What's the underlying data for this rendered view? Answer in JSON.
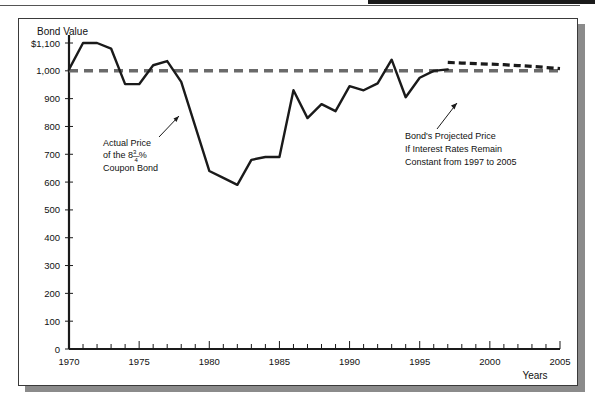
{
  "figure": {
    "y_axis_title": "Bond Value",
    "x_axis_title": "Years",
    "frame_color": "#3a3a3a",
    "shadow_color": "#8b8b8b",
    "series_color": "#1a1a1a",
    "par_line_color": "#6a6a6a"
  },
  "annotations": {
    "left": {
      "line1": "Actual Price",
      "line2_pre": "of the 8",
      "line2_num": "3",
      "line2_den": "4",
      "line2_post": "%",
      "line3": "Coupon Bond"
    },
    "right": {
      "line1": "Bond's Projected Price",
      "line2": "If Interest Rates Remain",
      "line3": "Constant from 1997 to 2005"
    }
  },
  "chart_data": {
    "type": "line",
    "title": "",
    "xlabel": "Years",
    "ylabel": "Bond Value",
    "xlim": [
      1970,
      2005
    ],
    "ylim": [
      0,
      1100
    ],
    "grid": false,
    "legend": "none",
    "y_ticks": [
      0,
      100,
      200,
      300,
      400,
      500,
      600,
      700,
      800,
      900,
      1000,
      1100
    ],
    "y_tick_labels": [
      "0",
      "100",
      "200",
      "300",
      "400",
      "500",
      "600",
      "700",
      "800",
      "900",
      "1,000",
      "$1,100"
    ],
    "x_ticks": [
      1970,
      1971,
      1972,
      1973,
      1974,
      1975,
      1976,
      1977,
      1978,
      1979,
      1980,
      1981,
      1982,
      1983,
      1984,
      1985,
      1986,
      1987,
      1988,
      1989,
      1990,
      1991,
      1992,
      1993,
      1994,
      1995,
      1996,
      1997,
      1998,
      1999,
      2000,
      2001,
      2002,
      2003,
      2004,
      2005
    ],
    "x_tick_labels": [
      "1970",
      "1975",
      "1980",
      "1985",
      "1990",
      "1995",
      "2000",
      "2005"
    ],
    "x_labeled_ticks": [
      1970,
      1975,
      1980,
      1985,
      1990,
      1995,
      2000,
      2005
    ],
    "reference_line": {
      "name": "Par Value",
      "value": 1000,
      "style": "dashed",
      "color": "#6a6a6a"
    },
    "series": [
      {
        "name": "Actual Price of the 8 3/4% Coupon Bond",
        "style": "solid",
        "color": "#1a1a1a",
        "x": [
          1970,
          1971,
          1972,
          1973,
          1974,
          1975,
          1976,
          1977,
          1978,
          1979,
          1980,
          1981,
          1982,
          1983,
          1984,
          1985,
          1986,
          1987,
          1988,
          1989,
          1990,
          1991,
          1992,
          1993,
          1994,
          1995,
          1996,
          1997
        ],
        "values": [
          1005,
          1100,
          1100,
          1080,
          952,
          952,
          1020,
          1035,
          960,
          800,
          640,
          615,
          590,
          680,
          690,
          690,
          930,
          830,
          880,
          855,
          945,
          930,
          955,
          1040,
          905,
          975,
          1000,
          1005
        ]
      },
      {
        "name": "Bond's Projected Price If Interest Rates Remain Constant from 1997 to 2005",
        "style": "dashed",
        "color": "#1a1a1a",
        "x": [
          1997,
          1998,
          1999,
          2000,
          2001,
          2002,
          2003,
          2004,
          2005
        ],
        "values": [
          1030,
          1028,
          1026,
          1024,
          1022,
          1019,
          1016,
          1012,
          1008
        ]
      }
    ]
  }
}
